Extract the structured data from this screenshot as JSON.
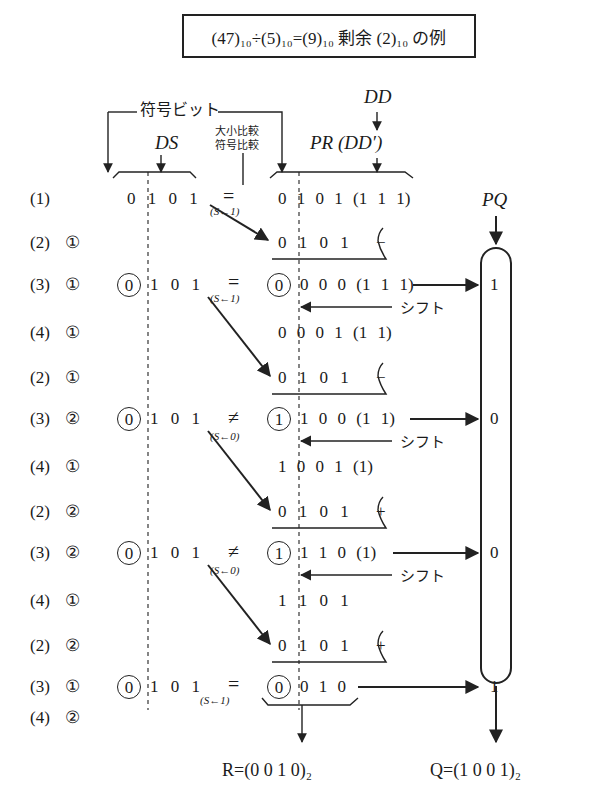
{
  "title": "(47)₁₀÷(5)₁₀=(9)₁₀ 剰余 (2)₁₀ の例",
  "labels": {
    "sign_bit": "符号ビット",
    "ds": "DS",
    "dd": "DD",
    "pr": "PR (DD′)",
    "compare_magnitude": "大小比較",
    "compare_sign": "符号比較",
    "pq": "PQ",
    "shift": "シフト"
  },
  "rows": [
    {
      "step": "(1)",
      "sub": "",
      "ds": "0 1 0 1",
      "op": "=",
      "s": "(S←1)",
      "pr": "0 1 0 1 (1 1 1)"
    },
    {
      "step": "(2)",
      "sub": "①",
      "pr": "0 1 0 1",
      "sign": "−"
    },
    {
      "step": "(3)",
      "sub": "①",
      "ds_circled": "0",
      "ds": "1 0 1",
      "op": "=",
      "s": "(S←1)",
      "pr_circled": "0",
      "pr": "0 0 0 (1 1 1)",
      "q": "1"
    },
    {
      "step": "(4)",
      "sub": "①",
      "pr": "0 0 0 1 (1 1)"
    },
    {
      "step": "(2)",
      "sub": "①",
      "pr": "0 1 0 1",
      "sign": "−"
    },
    {
      "step": "(3)",
      "sub": "②",
      "ds_circled": "0",
      "ds": "1 0 1",
      "op": "≠",
      "s": "(S←0)",
      "pr_circled": "1",
      "pr": "1 0 0 (1 1)",
      "q": "0"
    },
    {
      "step": "(4)",
      "sub": "①",
      "pr": "1 0 0 1 (1)"
    },
    {
      "step": "(2)",
      "sub": "②",
      "pr": "0 1 0 1",
      "sign": "+"
    },
    {
      "step": "(3)",
      "sub": "②",
      "ds_circled": "0",
      "ds": "1 0 1",
      "op": "≠",
      "s": "(S←0)",
      "pr_circled": "1",
      "pr": "1 1 0 (1)",
      "q": "0"
    },
    {
      "step": "(4)",
      "sub": "①",
      "pr": "1 1 0 1"
    },
    {
      "step": "(2)",
      "sub": "②",
      "pr": "0 1 0 1",
      "sign": "+"
    },
    {
      "step": "(3)",
      "sub": "①",
      "ds_circled": "0",
      "ds": "1 0 1",
      "op": "=",
      "s": "(S←1)",
      "pr_circled": "0",
      "pr": "0 1 0",
      "q": "1"
    },
    {
      "step": "(4)",
      "sub": "②"
    }
  ],
  "results": {
    "remainder": "R=(0 0 1 0)₂",
    "quotient": "Q=(1 0 0 1)₂"
  }
}
